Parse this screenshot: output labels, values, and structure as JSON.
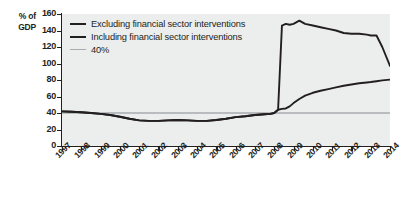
{
  "chart_data": {
    "type": "line",
    "title": "",
    "xlabel": "",
    "ylabel": "% of GDP",
    "ylabel_line1": "% of",
    "ylabel_line2": "GDP",
    "ylim": [
      0,
      160
    ],
    "yticks": [
      160,
      140,
      120,
      100,
      80,
      60,
      40,
      20,
      0
    ],
    "xlim": [
      1997,
      2014
    ],
    "xticks": [
      "1997",
      "1998",
      "1999",
      "2000",
      "2001",
      "2002",
      "2003",
      "2004",
      "2005",
      "2006",
      "2007",
      "2008",
      "2009",
      "2010",
      "2011",
      "2012",
      "2013",
      "2014"
    ],
    "grid": false,
    "legend_position": "top-left",
    "x": [
      1997.0,
      1997.5,
      1998.0,
      1998.5,
      1999.0,
      1999.5,
      2000.0,
      2000.5,
      2001.0,
      2001.5,
      2002.0,
      2002.5,
      2003.0,
      2003.5,
      2004.0,
      2004.5,
      2005.0,
      2005.5,
      2006.0,
      2006.5,
      2007.0,
      2007.5,
      2007.8,
      2008.0,
      2008.2,
      2008.4,
      2008.6,
      2008.8,
      2009.0,
      2009.3,
      2009.6,
      2010.0,
      2010.4,
      2010.8,
      2011.2,
      2011.6,
      2012.0,
      2012.4,
      2012.8,
      2013.0,
      2013.3,
      2013.6,
      2014.0
    ],
    "series": [
      {
        "name": "Excluding financial sector interventions",
        "color": "#231f20",
        "values": [
          42,
          41.5,
          41,
          40,
          39,
          37.5,
          35.5,
          33,
          31,
          30.5,
          30.5,
          31,
          31.5,
          31,
          30.5,
          30.5,
          31.5,
          33,
          35,
          36,
          37.5,
          38.5,
          39,
          40,
          44,
          45,
          45.5,
          48,
          52,
          57,
          61,
          64.5,
          67,
          69,
          71,
          73,
          74.5,
          76,
          77,
          77.5,
          78.5,
          79.5,
          80.5
        ]
      },
      {
        "name": "Including financial sector interventions",
        "color": "#231f20",
        "values": [
          42,
          41.5,
          41,
          40,
          39,
          37.5,
          35.5,
          33,
          31,
          30.5,
          30.5,
          31,
          31.5,
          31,
          30.5,
          30.5,
          31.5,
          33,
          35,
          36,
          37.5,
          38.5,
          39,
          40,
          44,
          146,
          148,
          147,
          148,
          152,
          148,
          146,
          144,
          142,
          140,
          137,
          136,
          136,
          135,
          134,
          134,
          120,
          97
        ]
      }
    ],
    "reference_line": {
      "label": "40%",
      "value": 40,
      "color": "#a9abae"
    },
    "legend": [
      {
        "label": "Excluding financial sector interventions",
        "color": "#231f20",
        "style": "solid-thick"
      },
      {
        "label": "Including financial sector interventions",
        "color": "#231f20",
        "style": "solid-thick"
      },
      {
        "label": "40%",
        "color": "#a9abae",
        "style": "solid-thin"
      }
    ]
  },
  "colors": {
    "plot_background": "#eceded",
    "axis": "#231f20",
    "line": "#231f20",
    "reference": "#a9abae",
    "page_background": "#ffffff"
  }
}
